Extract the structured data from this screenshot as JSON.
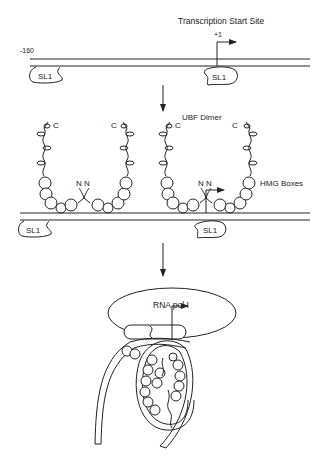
{
  "figure": {
    "panel1": {
      "position_label": "-160",
      "start_label": "Transcription Start Site",
      "plus_one": "+1",
      "sl1_left": "SL1",
      "sl1_right": "SL1"
    },
    "panel2": {
      "dimer_label": "UBF Dimer",
      "hmg_label": "HMG Boxes",
      "c_left_outer": "C",
      "c_left_inner": "C",
      "c_right_inner": "C",
      "c_right_outer": "C",
      "nn_left": "N N",
      "nn_right": "N N",
      "sl1_left": "SL1",
      "sl1_right": "SL1"
    },
    "panel3": {
      "pol_label": "RNA pol I"
    }
  }
}
